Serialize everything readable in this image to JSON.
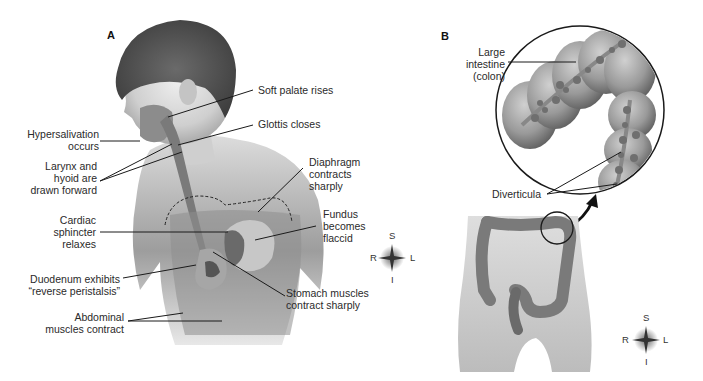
{
  "panels": {
    "a": {
      "letter": "A",
      "labels": {
        "soft_palate": "Soft palate rises",
        "glottis": "Glottis closes",
        "hypersalivation": "Hypersalivation\noccurs",
        "larynx": "Larynx and\nhyoid are\ndrawn forward",
        "diaphragm": "Diaphragm\ncontracts\nsharply",
        "fundus": "Fundus\nbecomes\nflaccid",
        "cardiac": "Cardiac\nsphincter\nrelaxes",
        "duodenum": "Duodenum exhibits\n“reverse peristalsis”",
        "stomach": "Stomach muscles\ncontract sharply",
        "abdominal": "Abdominal\nmuscles contract"
      },
      "compass": {
        "superior": "S",
        "inferior": "I",
        "right": "R",
        "left": "L"
      }
    },
    "b": {
      "letter": "B",
      "labels": {
        "large_intestine": "Large\nintestine\n(colon)",
        "diverticula": "Diverticula"
      },
      "compass": {
        "superior": "S",
        "inferior": "I",
        "right": "R",
        "left": "L"
      }
    }
  },
  "colors": {
    "skin_light": "#e6e6e6",
    "skin_mid": "#b8b8b8",
    "hair": "#5a5a5a",
    "organ": "#7d7d7d",
    "line": "#1a1a1a"
  }
}
